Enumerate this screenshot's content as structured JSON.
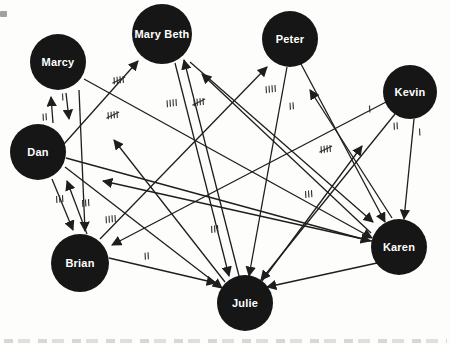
{
  "figure": {
    "type": "sociogram",
    "background": "#fdfdfc",
    "node_fill": "#161616",
    "node_text_color": "#ffffff",
    "edge_color": "#1e1e1e",
    "tally_color": "#2e2e2e",
    "node_font_size": 11
  },
  "nodes": [
    {
      "id": "marcy",
      "label": "Marcy",
      "x": 58,
      "y": 62,
      "r": 28
    },
    {
      "id": "marybeth",
      "label": "Mary Beth",
      "x": 162,
      "y": 34,
      "r": 30
    },
    {
      "id": "peter",
      "label": "Peter",
      "x": 290,
      "y": 39,
      "r": 28
    },
    {
      "id": "kevin",
      "label": "Kevin",
      "x": 410,
      "y": 92,
      "r": 27
    },
    {
      "id": "dan",
      "label": "Dan",
      "x": 38,
      "y": 152,
      "r": 28
    },
    {
      "id": "brian",
      "label": "Brian",
      "x": 80,
      "y": 263,
      "r": 29
    },
    {
      "id": "karen",
      "label": "Karen",
      "x": 399,
      "y": 247,
      "r": 28
    },
    {
      "id": "julie",
      "label": "Julie",
      "x": 245,
      "y": 303,
      "r": 28
    }
  ],
  "edges": [
    {
      "from": "marcy",
      "to": "dan",
      "x1": 66,
      "y1": 93,
      "x2": 69,
      "y2": 119
    },
    {
      "from": "dan",
      "to": "marcy",
      "x1": 53,
      "y1": 123,
      "x2": 51,
      "y2": 97
    },
    {
      "from": "marcy",
      "to": "brian",
      "x1": 79,
      "y1": 90,
      "x2": 85,
      "y2": 231
    },
    {
      "from": "dan",
      "to": "brian",
      "x1": 52,
      "y1": 179,
      "x2": 73,
      "y2": 230
    },
    {
      "from": "brian",
      "to": "dan",
      "x1": 87,
      "y1": 234,
      "x2": 67,
      "y2": 181
    },
    {
      "from": "dan",
      "to": "marybeth",
      "x1": 64,
      "y1": 144,
      "x2": 138,
      "y2": 61
    },
    {
      "from": "dan",
      "to": "julie",
      "x1": 65,
      "y1": 167,
      "x2": 222,
      "y2": 288
    },
    {
      "from": "dan",
      "to": "karen",
      "x1": 66,
      "y1": 158,
      "x2": 370,
      "y2": 241
    },
    {
      "from": "marcy",
      "to": "karen",
      "x1": 84,
      "y1": 79,
      "x2": 372,
      "y2": 238
    },
    {
      "from": "brian",
      "to": "peter",
      "x1": 100,
      "y1": 239,
      "x2": 267,
      "y2": 67
    },
    {
      "from": "brian",
      "to": "julie",
      "x1": 109,
      "y1": 258,
      "x2": 216,
      "y2": 283
    },
    {
      "from": "kevin",
      "to": "brian",
      "x1": 386,
      "y1": 102,
      "x2": 112,
      "y2": 245
    },
    {
      "from": "kevin",
      "to": "julie",
      "x1": 395,
      "y1": 114,
      "x2": 261,
      "y2": 280
    },
    {
      "from": "kevin",
      "to": "karen",
      "x1": 414,
      "y1": 119,
      "x2": 404,
      "y2": 219
    },
    {
      "from": "marybeth",
      "to": "julie",
      "x1": 175,
      "y1": 63,
      "x2": 229,
      "y2": 276
    },
    {
      "from": "julie",
      "to": "marybeth",
      "x1": 239,
      "y1": 276,
      "x2": 184,
      "y2": 60
    },
    {
      "from": "peter",
      "to": "julie",
      "x1": 287,
      "y1": 67,
      "x2": 249,
      "y2": 276
    },
    {
      "from": "peter",
      "to": "karen",
      "x1": 301,
      "y1": 64,
      "x2": 385,
      "y2": 222
    },
    {
      "from": "karen",
      "to": "peter",
      "x1": 392,
      "y1": 218,
      "x2": 310,
      "y2": 90
    },
    {
      "from": "karen",
      "to": "julie",
      "x1": 377,
      "y1": 263,
      "x2": 267,
      "y2": 287
    },
    {
      "from": "karen",
      "to": "marybeth",
      "x1": 371,
      "y1": 233,
      "x2": 202,
      "y2": 74
    },
    {
      "from": "marybeth",
      "to": "karen",
      "x1": 190,
      "y1": 62,
      "x2": 373,
      "y2": 222
    },
    {
      "from": "karen",
      "to": "dan",
      "x1": 372,
      "y1": 241,
      "x2": 103,
      "y2": 181
    },
    {
      "from": "julie",
      "to": "marcy",
      "x1": 225,
      "y1": 282,
      "x2": 114,
      "y2": 140
    },
    {
      "from": "julie",
      "to": "kevin",
      "x1": 262,
      "y1": 281,
      "x2": 362,
      "y2": 146
    }
  ],
  "tallies": [
    {
      "x": 63,
      "y": 97,
      "marks": 1
    },
    {
      "x": 45,
      "y": 117,
      "marks": 2
    },
    {
      "x": 119,
      "y": 80,
      "marks": 5
    },
    {
      "x": 113,
      "y": 115,
      "marks": 5
    },
    {
      "x": 172,
      "y": 103,
      "marks": 4
    },
    {
      "x": 199,
      "y": 102,
      "marks": 5
    },
    {
      "x": 271,
      "y": 89,
      "marks": 4
    },
    {
      "x": 292,
      "y": 106,
      "marks": 2
    },
    {
      "x": 370,
      "y": 109,
      "marks": 1
    },
    {
      "x": 396,
      "y": 126,
      "marks": 2
    },
    {
      "x": 420,
      "y": 132,
      "marks": 1
    },
    {
      "x": 326,
      "y": 149,
      "marks": 5
    },
    {
      "x": 309,
      "y": 194,
      "marks": 3
    },
    {
      "x": 60,
      "y": 199,
      "marks": 3
    },
    {
      "x": 86,
      "y": 203,
      "marks": 3
    },
    {
      "x": 111,
      "y": 219,
      "marks": 4
    },
    {
      "x": 215,
      "y": 229,
      "marks": 3
    },
    {
      "x": 147,
      "y": 256,
      "marks": 2
    }
  ]
}
